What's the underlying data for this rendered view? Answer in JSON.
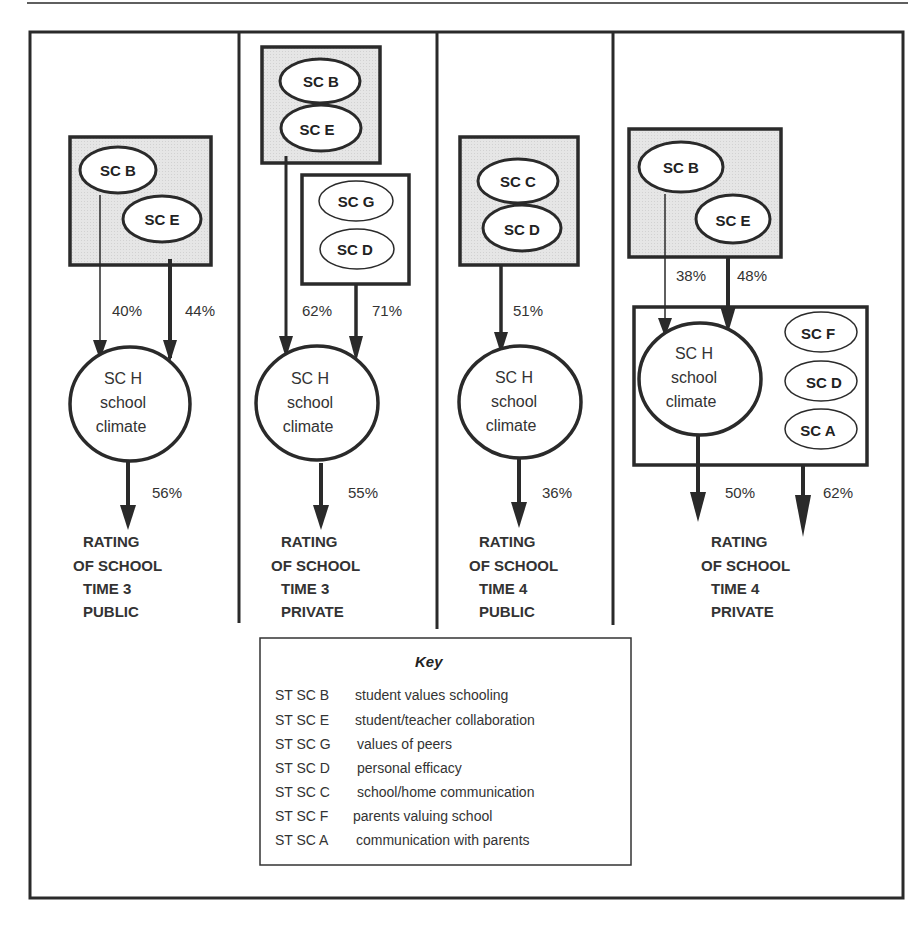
{
  "colors": {
    "stroke": "#2a2a2a",
    "shaded_box": "#e4e4e4",
    "background": "#ffffff"
  },
  "panels": [
    {
      "id": "time3-public",
      "predictor_group": [
        "SC B",
        "SC E"
      ],
      "paths": [
        {
          "from": "SC B",
          "to": "SC H",
          "value": "40%"
        },
        {
          "from": "SC E",
          "to": "SC H",
          "value": "44%"
        }
      ],
      "mediator": {
        "code": "SC H",
        "line2": "school",
        "line3": "climate"
      },
      "outcome_path": {
        "value": "56%"
      },
      "outcome": [
        "RATING",
        "OF SCHOOL",
        "TIME 3",
        "PUBLIC"
      ]
    },
    {
      "id": "time3-private",
      "predictor_group": [
        "SC B",
        "SC E"
      ],
      "secondary_group": [
        "SC G",
        "SC D"
      ],
      "paths": [
        {
          "from": "SC B/SC E",
          "to": "SC H",
          "value": "62%"
        },
        {
          "from": "SC G/SC D",
          "to": "SC H",
          "value": "71%"
        }
      ],
      "mediator": {
        "code": "SC H",
        "line2": "school",
        "line3": "climate"
      },
      "outcome_path": {
        "value": "55%"
      },
      "outcome": [
        "RATING",
        "OF SCHOOL",
        "TIME 3",
        "PRIVATE"
      ]
    },
    {
      "id": "time4-public",
      "predictor_group": [
        "SC C",
        "SC D"
      ],
      "paths": [
        {
          "from": "SC C/SC D",
          "to": "SC H",
          "value": "51%"
        }
      ],
      "mediator": {
        "code": "SC H",
        "line2": "school",
        "line3": "climate"
      },
      "outcome_path": {
        "value": "36%"
      },
      "outcome": [
        "RATING",
        "OF SCHOOL",
        "TIME 4",
        "PUBLIC"
      ]
    },
    {
      "id": "time4-private",
      "predictor_group": [
        "SC B",
        "SC E"
      ],
      "side_group": [
        "SC F",
        "SC D",
        "SC A"
      ],
      "paths": [
        {
          "from": "SC B",
          "to": "SC H",
          "value": "38%"
        },
        {
          "from": "SC E",
          "to": "SC H",
          "value": "48%"
        }
      ],
      "mediator": {
        "code": "SC H",
        "line2": "school",
        "line3": "climate"
      },
      "outcome_paths": [
        {
          "from": "SC H",
          "value": "50%"
        },
        {
          "from": "SC F/SC D/SC A",
          "value": "62%"
        }
      ],
      "outcome": [
        "RATING",
        "OF SCHOOL",
        "TIME 4",
        "PRIVATE"
      ]
    }
  ],
  "key": {
    "title": "Key",
    "rows": [
      {
        "code": "ST SC B",
        "desc": "student values schooling"
      },
      {
        "code": "ST SC E",
        "desc": "student/teacher collaboration"
      },
      {
        "code": "ST SC G",
        "desc": "values of peers"
      },
      {
        "code": "ST SC D",
        "desc": "personal efficacy"
      },
      {
        "code": "ST SC C",
        "desc": "school/home communication"
      },
      {
        "code": "ST SC F",
        "desc": "parents valuing school"
      },
      {
        "code": "ST SC A",
        "desc": "communication with parents"
      }
    ]
  }
}
